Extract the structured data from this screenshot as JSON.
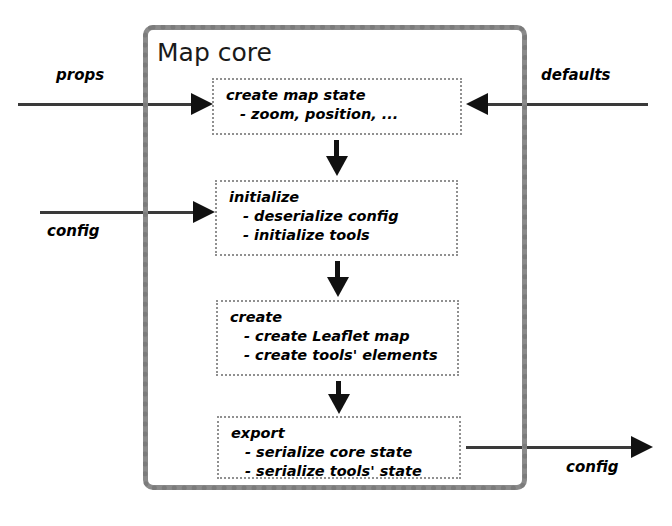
{
  "diagram": {
    "container": {
      "title": "Map core"
    },
    "steps": [
      {
        "id": "create-map-state",
        "title": "create map state",
        "items": [
          "- zoom, position, ..."
        ]
      },
      {
        "id": "initialize",
        "title": "initialize",
        "items": [
          "- deserialize config",
          "- initialize tools"
        ]
      },
      {
        "id": "create",
        "title": "create",
        "items": [
          "- create Leaflet map",
          "- create tools' elements"
        ]
      },
      {
        "id": "export",
        "title": "export",
        "items": [
          "- serialize core state",
          "- serialize tools' state"
        ]
      }
    ],
    "edges": {
      "props_in": "props",
      "defaults_in": "defaults",
      "config_in": "config",
      "config_out": "config"
    },
    "colors": {
      "frame_border": "#8a8a8a",
      "box_border": "#909090",
      "arrow": "#111111",
      "text": "#000000",
      "background": "#ffffff"
    }
  }
}
